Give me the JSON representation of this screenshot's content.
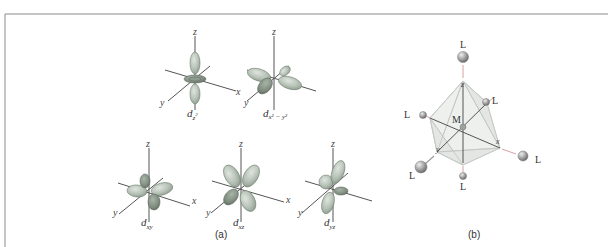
{
  "figure": {
    "panel_a": {
      "label": "(a)",
      "orbitals": [
        {
          "name": "d_z2",
          "base": "d",
          "sub": "z",
          "sup": "2",
          "axes": {
            "z": "z",
            "x": "x",
            "y": "y"
          }
        },
        {
          "name": "d_x2-y2",
          "base": "d",
          "sub": "x² − y²",
          "axes": {
            "z": "z",
            "x": "x",
            "y": "y"
          }
        },
        {
          "name": "d_xy",
          "base": "d",
          "sub": "xy",
          "axes": {
            "z": "z",
            "x": "x",
            "y": "y"
          }
        },
        {
          "name": "d_xz",
          "base": "d",
          "sub": "xz",
          "axes": {
            "z": "z",
            "x": "x",
            "y": "y"
          }
        },
        {
          "name": "d_yz",
          "base": "d",
          "sub": "yz",
          "axes": {
            "z": "z",
            "x": "x",
            "y": "y"
          }
        }
      ]
    },
    "panel_b": {
      "label": "(b)",
      "center": "M",
      "ligand": "L",
      "axes": {
        "z": "z",
        "x": "x",
        "y": "y"
      },
      "ligand_labels": [
        "L",
        "L",
        "L",
        "L",
        "L",
        "L"
      ]
    }
  }
}
